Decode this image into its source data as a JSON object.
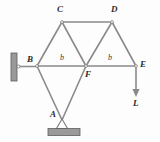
{
  "figure": {
    "background_color": "#fdfdfd",
    "member_color": "#8a8a8a",
    "support_color": "#8a8a8a",
    "label_color": "#2b2b2b"
  },
  "labels": {
    "node_a": "A",
    "node_b": "B",
    "node_c": "C",
    "node_d": "D",
    "node_e": "E",
    "node_f": "F",
    "dim_left": "b",
    "dim_right": "b",
    "load": "L"
  },
  "geometry": {
    "nodes": [
      {
        "id": "A",
        "x": 62,
        "y": 116
      },
      {
        "id": "B",
        "x": 37,
        "y": 66
      },
      {
        "id": "C",
        "x": 62,
        "y": 22
      },
      {
        "id": "D",
        "x": 112,
        "y": 22
      },
      {
        "id": "E",
        "x": 136,
        "y": 66
      },
      {
        "id": "F",
        "x": 86,
        "y": 66
      }
    ],
    "members": [
      {
        "from": "B",
        "to": "C"
      },
      {
        "from": "C",
        "to": "D"
      },
      {
        "from": "C",
        "to": "F"
      },
      {
        "from": "D",
        "to": "F"
      },
      {
        "from": "D",
        "to": "E"
      },
      {
        "from": "B",
        "to": "F"
      },
      {
        "from": "F",
        "to": "E"
      },
      {
        "from": "B",
        "to": "A"
      },
      {
        "from": "A",
        "to": "F"
      }
    ],
    "load_arrow": {
      "x": 136,
      "y_start": 68,
      "y_end": 96
    },
    "wall_plate": {
      "x": 11,
      "y": 53,
      "width": 6,
      "height": 28
    },
    "wall_stub": {
      "x1": 17,
      "y1": 66,
      "x2": 37,
      "y2": 66
    },
    "ground_plate": {
      "x": 48,
      "y": 128,
      "width": 32,
      "height": 7
    }
  },
  "supports": {
    "wall_support_type": "pin-on-wall",
    "ground_support_type": "pin-on-ground"
  }
}
